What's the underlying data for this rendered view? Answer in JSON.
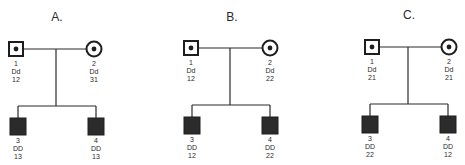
{
  "figure": {
    "panels": [
      {
        "title": "A.",
        "parents": [
          {
            "id": "1",
            "sex": "male",
            "status": "carrier",
            "genotype": "Dd",
            "haplotype": "12"
          },
          {
            "id": "2",
            "sex": "female",
            "status": "carrier",
            "genotype": "Dd",
            "haplotype": "31"
          }
        ],
        "children": [
          {
            "id": "3",
            "sex": "male",
            "status": "affected",
            "genotype": "DD",
            "haplotype": "13"
          },
          {
            "id": "4",
            "sex": "male",
            "status": "affected",
            "genotype": "DD",
            "haplotype": "13"
          }
        ]
      },
      {
        "title": "B.",
        "parents": [
          {
            "id": "1",
            "sex": "male",
            "status": "carrier",
            "genotype": "Dd",
            "haplotype": "12"
          },
          {
            "id": "2",
            "sex": "female",
            "status": "carrier",
            "genotype": "Dd",
            "haplotype": "22"
          }
        ],
        "children": [
          {
            "id": "3",
            "sex": "male",
            "status": "affected",
            "genotype": "DD",
            "haplotype": "12"
          },
          {
            "id": "4",
            "sex": "male",
            "status": "affected",
            "genotype": "DD",
            "haplotype": "22"
          }
        ]
      },
      {
        "title": "C.",
        "parents": [
          {
            "id": "1",
            "sex": "male",
            "status": "carrier",
            "genotype": "Dd",
            "haplotype": "21"
          },
          {
            "id": "2",
            "sex": "female",
            "status": "carrier",
            "genotype": "Dd",
            "haplotype": "21"
          }
        ],
        "children": [
          {
            "id": "3",
            "sex": "male",
            "status": "affected",
            "genotype": "DD",
            "haplotype": "22"
          },
          {
            "id": "4",
            "sex": "male",
            "status": "affected",
            "genotype": "DD",
            "haplotype": "12"
          }
        ]
      }
    ],
    "colors": {
      "ink": "#2a2a2a",
      "background": "#ffffff"
    }
  }
}
